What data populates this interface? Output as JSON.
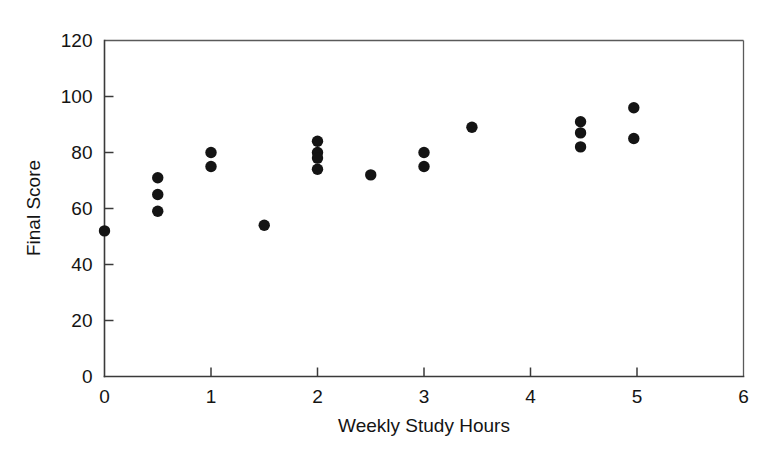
{
  "chart_data": {
    "type": "scatter",
    "title": "",
    "xlabel": "Weekly Study Hours",
    "ylabel": "Final Score",
    "xlim": [
      0,
      6
    ],
    "ylim": [
      0,
      120
    ],
    "xticks": [
      0,
      1,
      2,
      3,
      4,
      5,
      6
    ],
    "xtick_labels": [
      "0",
      "1",
      "2",
      "3",
      "4",
      "5",
      "6"
    ],
    "yticks": [
      0,
      20,
      40,
      60,
      80,
      100,
      120
    ],
    "ytick_labels": [
      "0",
      "20",
      "40",
      "60",
      "80",
      "100",
      "120"
    ],
    "grid": false,
    "legend": null,
    "marker": "filled-circle",
    "marker_color": "#141414",
    "marker_size": 9,
    "points": [
      {
        "x": 0.0,
        "y": 52
      },
      {
        "x": 0.5,
        "y": 71
      },
      {
        "x": 0.5,
        "y": 65
      },
      {
        "x": 0.5,
        "y": 59
      },
      {
        "x": 1.0,
        "y": 80
      },
      {
        "x": 1.0,
        "y": 75
      },
      {
        "x": 1.5,
        "y": 54
      },
      {
        "x": 2.0,
        "y": 84
      },
      {
        "x": 2.0,
        "y": 80
      },
      {
        "x": 2.0,
        "y": 78
      },
      {
        "x": 2.0,
        "y": 74
      },
      {
        "x": 2.5,
        "y": 72
      },
      {
        "x": 3.0,
        "y": 80
      },
      {
        "x": 3.0,
        "y": 75
      },
      {
        "x": 3.45,
        "y": 89
      },
      {
        "x": 4.47,
        "y": 91
      },
      {
        "x": 4.47,
        "y": 87
      },
      {
        "x": 4.47,
        "y": 82
      },
      {
        "x": 4.97,
        "y": 96
      },
      {
        "x": 4.97,
        "y": 85
      }
    ]
  },
  "axes": {
    "x_title": "Weekly Study Hours",
    "y_title": "Final Score"
  },
  "colors": {
    "marker": "#141414",
    "axis": "#3a3a3a",
    "frame": "#5a5a5a",
    "text": "#141414",
    "background": "#ffffff"
  }
}
